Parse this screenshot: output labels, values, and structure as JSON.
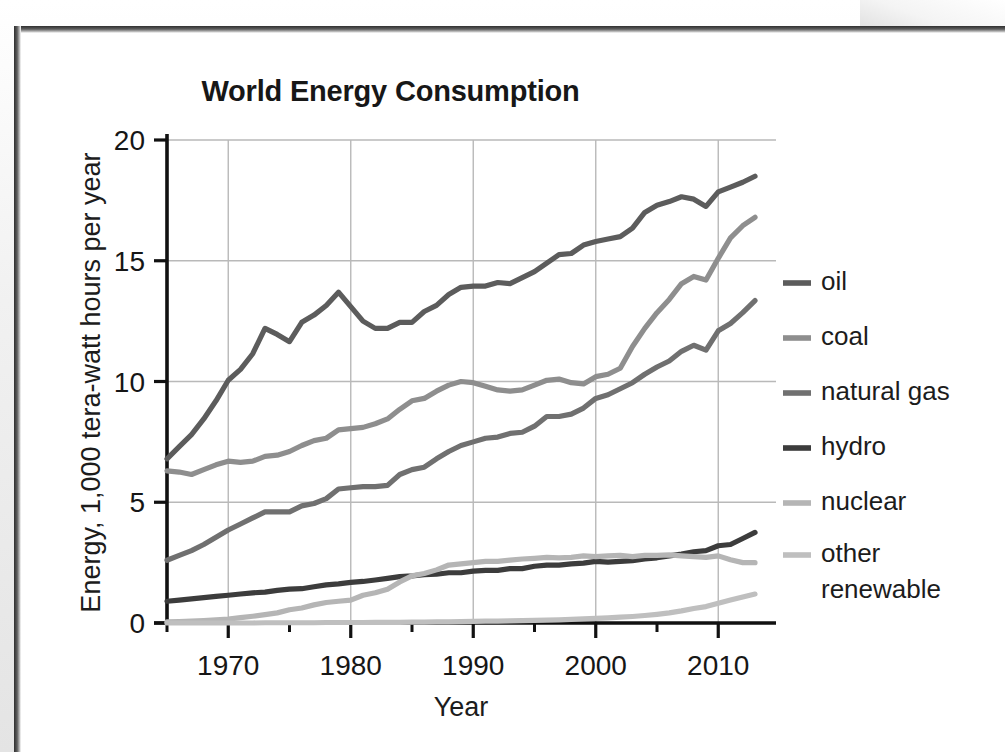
{
  "chart_data": {
    "type": "line",
    "title": "World Energy Consumption",
    "xlabel": "Year",
    "ylabel": "Energy, 1,000 tera-watt hours per year",
    "xlim": [
      1965,
      2013
    ],
    "ylim": [
      0,
      20
    ],
    "xticks": [
      1970,
      1980,
      1990,
      2000,
      2010
    ],
    "xtick_labels": [
      "1970",
      "1980",
      "1990",
      "2000",
      "2010"
    ],
    "xminor_ticks": [
      1965,
      1975,
      1985,
      1995,
      2005
    ],
    "yticks": [
      0,
      5,
      10,
      15,
      20
    ],
    "ytick_labels": [
      "0",
      "5",
      "10",
      "15",
      "20"
    ],
    "grid": "both",
    "legend_position": "right",
    "x": [
      1965,
      1966,
      1967,
      1968,
      1969,
      1970,
      1971,
      1972,
      1973,
      1974,
      1975,
      1976,
      1977,
      1978,
      1979,
      1980,
      1981,
      1982,
      1983,
      1984,
      1985,
      1986,
      1987,
      1988,
      1989,
      1990,
      1991,
      1992,
      1993,
      1994,
      1995,
      1996,
      1997,
      1998,
      1999,
      2000,
      2001,
      2002,
      2003,
      2004,
      2005,
      2006,
      2007,
      2008,
      2009,
      2010,
      2011,
      2012,
      2013
    ],
    "series": [
      {
        "name": "oil",
        "color": "#5c5c5c",
        "values": [
          6.8,
          7.3,
          7.8,
          8.45,
          9.2,
          10.05,
          10.5,
          11.15,
          12.2,
          11.95,
          11.65,
          12.45,
          12.75,
          13.15,
          13.7,
          13.1,
          12.5,
          12.2,
          12.2,
          12.45,
          12.45,
          12.9,
          13.15,
          13.6,
          13.9,
          13.95,
          13.95,
          14.1,
          14.05,
          14.3,
          14.55,
          14.9,
          15.25,
          15.3,
          15.65,
          15.8,
          15.9,
          16.0,
          16.35,
          17.0,
          17.3,
          17.45,
          17.65,
          17.55,
          17.25,
          17.85,
          18.05,
          18.25,
          18.5
        ]
      },
      {
        "name": "coal",
        "color": "#8e8e8e",
        "values": [
          6.3,
          6.25,
          6.15,
          6.35,
          6.55,
          6.7,
          6.65,
          6.7,
          6.9,
          6.95,
          7.1,
          7.35,
          7.55,
          7.65,
          8.0,
          8.05,
          8.1,
          8.25,
          8.45,
          8.85,
          9.2,
          9.3,
          9.6,
          9.85,
          10.0,
          9.95,
          9.8,
          9.65,
          9.6,
          9.65,
          9.85,
          10.05,
          10.1,
          9.95,
          9.9,
          10.2,
          10.3,
          10.55,
          11.45,
          12.2,
          12.85,
          13.4,
          14.05,
          14.35,
          14.2,
          15.1,
          15.95,
          16.45,
          16.8
        ]
      },
      {
        "name": "natural gas",
        "color": "#707070",
        "values": [
          2.6,
          2.8,
          3.0,
          3.25,
          3.55,
          3.85,
          4.1,
          4.35,
          4.6,
          4.6,
          4.6,
          4.85,
          4.95,
          5.15,
          5.55,
          5.6,
          5.65,
          5.65,
          5.7,
          6.15,
          6.35,
          6.45,
          6.8,
          7.1,
          7.35,
          7.5,
          7.65,
          7.7,
          7.85,
          7.9,
          8.15,
          8.55,
          8.55,
          8.65,
          8.9,
          9.3,
          9.45,
          9.7,
          9.95,
          10.3,
          10.6,
          10.85,
          11.25,
          11.5,
          11.3,
          12.1,
          12.4,
          12.85,
          13.35
        ]
      },
      {
        "name": "hydro",
        "color": "#3c3c3c",
        "values": [
          0.9,
          0.95,
          1.0,
          1.05,
          1.1,
          1.15,
          1.2,
          1.25,
          1.28,
          1.35,
          1.4,
          1.42,
          1.5,
          1.58,
          1.62,
          1.68,
          1.72,
          1.78,
          1.85,
          1.92,
          1.95,
          2.0,
          2.02,
          2.08,
          2.08,
          2.15,
          2.18,
          2.18,
          2.25,
          2.25,
          2.35,
          2.4,
          2.4,
          2.45,
          2.48,
          2.55,
          2.52,
          2.55,
          2.58,
          2.65,
          2.7,
          2.78,
          2.85,
          2.95,
          3.0,
          3.2,
          3.25,
          3.5,
          3.75
        ]
      },
      {
        "name": "nuclear",
        "color": "#b5b5b5",
        "values": [
          0.05,
          0.06,
          0.08,
          0.1,
          0.13,
          0.16,
          0.22,
          0.28,
          0.35,
          0.42,
          0.55,
          0.62,
          0.75,
          0.85,
          0.9,
          0.95,
          1.15,
          1.25,
          1.4,
          1.7,
          1.95,
          2.05,
          2.2,
          2.4,
          2.45,
          2.5,
          2.55,
          2.55,
          2.6,
          2.65,
          2.68,
          2.72,
          2.7,
          2.72,
          2.78,
          2.75,
          2.78,
          2.8,
          2.75,
          2.8,
          2.8,
          2.82,
          2.78,
          2.75,
          2.72,
          2.78,
          2.62,
          2.5,
          2.5
        ]
      },
      {
        "name": "other renewable",
        "color": "#bfbfbf",
        "values": [
          0.0,
          0.0,
          0.0,
          0.0,
          0.0,
          0.0,
          0.0,
          0.0,
          0.01,
          0.01,
          0.01,
          0.01,
          0.01,
          0.02,
          0.02,
          0.02,
          0.02,
          0.03,
          0.03,
          0.03,
          0.04,
          0.04,
          0.05,
          0.05,
          0.06,
          0.07,
          0.08,
          0.08,
          0.09,
          0.1,
          0.11,
          0.12,
          0.13,
          0.15,
          0.17,
          0.19,
          0.21,
          0.24,
          0.27,
          0.31,
          0.36,
          0.42,
          0.5,
          0.6,
          0.68,
          0.82,
          0.95,
          1.08,
          1.2
        ]
      }
    ],
    "legend": [
      {
        "label": "oil",
        "color": "#5c5c5c"
      },
      {
        "label": "coal",
        "color": "#8e8e8e"
      },
      {
        "label": "natural gas",
        "color": "#707070"
      },
      {
        "label": "hydro",
        "color": "#3c3c3c"
      },
      {
        "label": "nuclear",
        "color": "#b5b5b5"
      },
      {
        "label": "other",
        "label2": "renewable",
        "color": "#bfbfbf"
      }
    ]
  },
  "figure": {
    "axis_color": "#111111",
    "grid_color": "#b9b9b9",
    "background": "#ffffff"
  }
}
